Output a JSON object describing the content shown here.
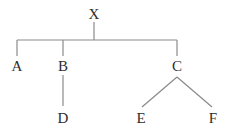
{
  "diagram": {
    "type": "tree",
    "root": "X",
    "nodes": [
      {
        "id": "X",
        "label": "X",
        "x": 94,
        "y": 14
      },
      {
        "id": "A",
        "label": "A",
        "x": 17,
        "y": 66
      },
      {
        "id": "B",
        "label": "B",
        "x": 63,
        "y": 66
      },
      {
        "id": "C",
        "label": "C",
        "x": 177,
        "y": 66
      },
      {
        "id": "D",
        "label": "D",
        "x": 63,
        "y": 118
      },
      {
        "id": "E",
        "label": "E",
        "x": 141,
        "y": 118
      },
      {
        "id": "F",
        "label": "F",
        "x": 213,
        "y": 118
      }
    ],
    "edges": [
      {
        "from": "X",
        "to": "A",
        "style": "bracket"
      },
      {
        "from": "X",
        "to": "B",
        "style": "bracket"
      },
      {
        "from": "X",
        "to": "C",
        "style": "bracket"
      },
      {
        "from": "B",
        "to": "D",
        "style": "vertical"
      },
      {
        "from": "C",
        "to": "E",
        "style": "diagonal"
      },
      {
        "from": "C",
        "to": "F",
        "style": "diagonal"
      }
    ],
    "colors": {
      "line": "#8a8a8a",
      "text": "#2e2e2e",
      "background": "#ffffff"
    }
  }
}
